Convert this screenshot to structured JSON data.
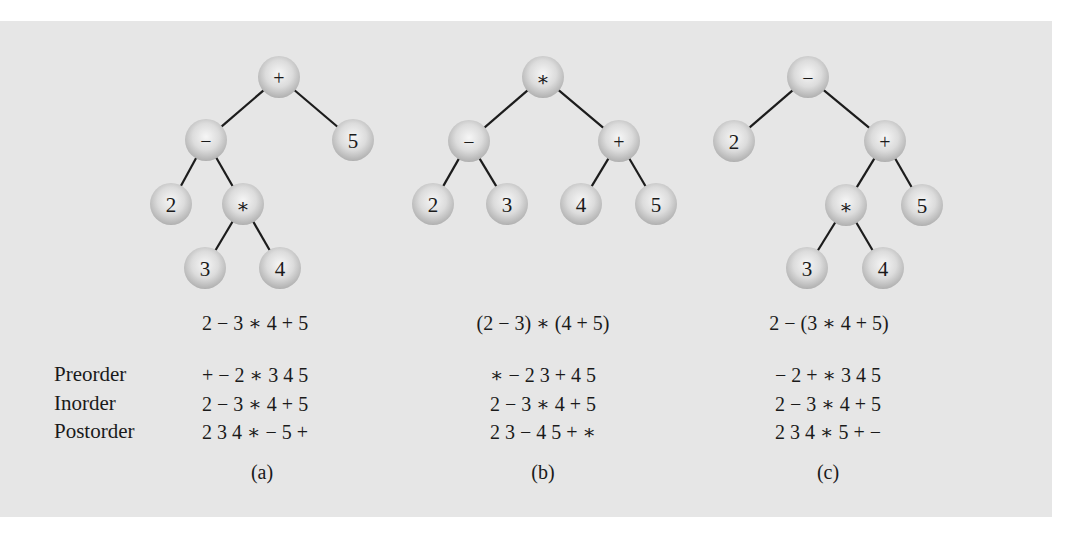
{
  "figure": {
    "colors": {
      "panel_background": "#e6e6e6",
      "page_background": "#ffffff",
      "node_fill_light": "#f4f4f4",
      "node_fill_dark": "#b5b5b5",
      "edge": "#1c1c1c",
      "text": "#1a1a1a"
    },
    "row_labels": {
      "preorder": "Preorder",
      "inorder": "Inorder",
      "postorder": "Postorder"
    },
    "trees": [
      {
        "id": "a",
        "caption": "(a)",
        "expression": "2 − 3 ∗ 4 + 5",
        "preorder": "+ − 2 ∗ 3 4 5",
        "inorder": "2 − 3 ∗ 4 + 5",
        "postorder": "2 3 4 ∗ − 5 +",
        "nodes": [
          {
            "id": "a-root",
            "label": "+",
            "x": 279,
            "y": 77
          },
          {
            "id": "a-minus",
            "label": "−",
            "x": 206,
            "y": 140
          },
          {
            "id": "a-5",
            "label": "5",
            "x": 353,
            "y": 140
          },
          {
            "id": "a-2",
            "label": "2",
            "x": 171,
            "y": 204
          },
          {
            "id": "a-times",
            "label": "∗",
            "x": 243,
            "y": 204
          },
          {
            "id": "a-3",
            "label": "3",
            "x": 205,
            "y": 268
          },
          {
            "id": "a-4",
            "label": "4",
            "x": 280,
            "y": 268
          }
        ],
        "edges": [
          [
            "a-root",
            "a-minus"
          ],
          [
            "a-root",
            "a-5"
          ],
          [
            "a-minus",
            "a-2"
          ],
          [
            "a-minus",
            "a-times"
          ],
          [
            "a-times",
            "a-3"
          ],
          [
            "a-times",
            "a-4"
          ]
        ]
      },
      {
        "id": "b",
        "caption": "(b)",
        "expression": "(2 − 3) ∗ (4 + 5)",
        "preorder": "∗ − 2 3 + 4 5",
        "inorder": "2 − 3 ∗ 4 + 5",
        "postorder": "2 3 − 4 5 + ∗",
        "nodes": [
          {
            "id": "b-root",
            "label": "∗",
            "x": 543,
            "y": 77
          },
          {
            "id": "b-minus",
            "label": "−",
            "x": 469,
            "y": 141
          },
          {
            "id": "b-plus",
            "label": "+",
            "x": 619,
            "y": 141
          },
          {
            "id": "b-2",
            "label": "2",
            "x": 433,
            "y": 204
          },
          {
            "id": "b-3",
            "label": "3",
            "x": 507,
            "y": 204
          },
          {
            "id": "b-4",
            "label": "4",
            "x": 581,
            "y": 204
          },
          {
            "id": "b-5",
            "label": "5",
            "x": 656,
            "y": 204
          }
        ],
        "edges": [
          [
            "b-root",
            "b-minus"
          ],
          [
            "b-root",
            "b-plus"
          ],
          [
            "b-minus",
            "b-2"
          ],
          [
            "b-minus",
            "b-3"
          ],
          [
            "b-plus",
            "b-4"
          ],
          [
            "b-plus",
            "b-5"
          ]
        ]
      },
      {
        "id": "c",
        "caption": "(c)",
        "expression": "2 − (3 ∗ 4 + 5)",
        "preorder": "− 2 + ∗ 3 4 5",
        "inorder": "2 − 3 ∗ 4 + 5",
        "postorder": "2 3 4 ∗ 5 + −",
        "nodes": [
          {
            "id": "c-root",
            "label": "−",
            "x": 808,
            "y": 77
          },
          {
            "id": "c-2",
            "label": "2",
            "x": 734,
            "y": 141
          },
          {
            "id": "c-plus",
            "label": "+",
            "x": 885,
            "y": 141
          },
          {
            "id": "c-times",
            "label": "∗",
            "x": 846,
            "y": 205
          },
          {
            "id": "c-5",
            "label": "5",
            "x": 922,
            "y": 205
          },
          {
            "id": "c-3",
            "label": "3",
            "x": 807,
            "y": 268
          },
          {
            "id": "c-4",
            "label": "4",
            "x": 883,
            "y": 268
          }
        ],
        "edges": [
          [
            "c-root",
            "c-2"
          ],
          [
            "c-root",
            "c-plus"
          ],
          [
            "c-plus",
            "c-times"
          ],
          [
            "c-plus",
            "c-5"
          ],
          [
            "c-times",
            "c-3"
          ],
          [
            "c-times",
            "c-4"
          ]
        ]
      }
    ]
  }
}
